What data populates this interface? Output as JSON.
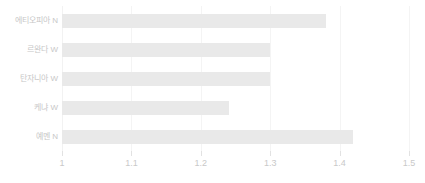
{
  "chart_data": {
    "type": "bar",
    "orientation": "horizontal",
    "title": "",
    "subtitle": "",
    "xlabel": "",
    "ylabel": "",
    "categories": [
      "에티오피아 N",
      "르완다 W",
      "탄자니아 W",
      "케냐 W",
      "예멘 N"
    ],
    "values": [
      1.38,
      1.3,
      1.3,
      1.24,
      1.42
    ],
    "xlim": [
      1,
      1.5
    ],
    "xticks": [
      1,
      1.1,
      1.2,
      1.3,
      1.4,
      1.5
    ],
    "xtick_labels": [
      "1",
      "1.1",
      "1.2",
      "1.3",
      "1.4",
      "1.5"
    ],
    "grid": true,
    "grid_axis": "x",
    "legend": false,
    "legend_position": "none",
    "bar_color": "#e9e9e9",
    "gridline_color": "#f4f4f4",
    "tick_label_color": "#c9c9c9",
    "category_label_color": "#c7c7c7",
    "background_color": "#ffffff",
    "series": [
      {
        "name": "",
        "values": [
          1.38,
          1.3,
          1.3,
          1.24,
          1.42
        ]
      }
    ],
    "points": [
      {
        "category": "에티오피아 N",
        "value": 1.38
      },
      {
        "category": "르완다 W",
        "value": 1.3
      },
      {
        "category": "탄자니아 W",
        "value": 1.3
      },
      {
        "category": "케냐 W",
        "value": 1.24
      },
      {
        "category": "예멘 N",
        "value": 1.42
      }
    ]
  }
}
